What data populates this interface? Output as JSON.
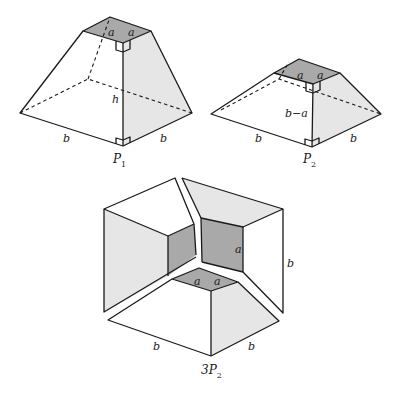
{
  "figures": {
    "p1": {
      "caption": "P",
      "caption_sub": "1",
      "labels": {
        "top_a_left": "a",
        "top_a_right": "a",
        "height": "h",
        "base_left": "b",
        "base_right": "b"
      }
    },
    "p2": {
      "caption": "P",
      "caption_sub": "2",
      "labels": {
        "top_a_left": "a",
        "top_a_right": "a",
        "height": "b−a",
        "base_left": "b",
        "base_right": "b"
      }
    },
    "p3": {
      "caption": "3P",
      "caption_sub": "2",
      "labels": {
        "inner_a_right": "a",
        "inner_a_bottom_left": "a",
        "inner_a_bottom_right": "a",
        "side_b": "b",
        "base_left": "b",
        "base_right": "b"
      }
    }
  },
  "colors": {
    "light_face": "#e6e6e6",
    "dark_face": "#a9a9a9",
    "stroke": "#1a1a1a"
  }
}
